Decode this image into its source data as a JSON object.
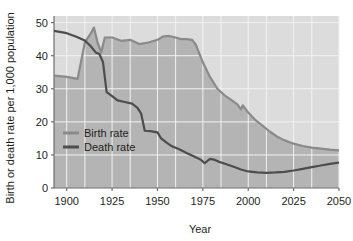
{
  "chart_data": {
    "type": "line",
    "title": "",
    "subtitle": "",
    "xlabel": "Year",
    "ylabel": "Birth or death rate per 1,000 population",
    "xlim": [
      1893,
      2050
    ],
    "ylim": [
      0,
      52
    ],
    "xticks": [
      1900,
      1925,
      1950,
      1975,
      2000,
      2025,
      2050
    ],
    "xtick_labels": [
      "1900",
      "1925",
      "1950",
      "1975",
      "2000",
      "2025",
      "2050"
    ],
    "yticks": [
      0,
      10,
      20,
      30,
      40,
      50
    ],
    "ytick_labels": [
      "0",
      "10",
      "20",
      "30",
      "40",
      "50"
    ],
    "grid": true,
    "legend_position": "inside-left",
    "series": [
      {
        "name": "Birth rate",
        "color": "#8a8a8a",
        "x": [
          1893,
          1900,
          1906,
          1908,
          1910,
          1913,
          1915,
          1917,
          1919,
          1921,
          1925,
          1930,
          1935,
          1940,
          1945,
          1950,
          1953,
          1956,
          1960,
          1963,
          1966,
          1969,
          1971,
          1975,
          1979,
          1983,
          1987,
          1991,
          1994,
          1996,
          1997,
          2000,
          2004,
          2008,
          2012,
          2016,
          2020,
          2025,
          2030,
          2035,
          2040,
          2045,
          2050
        ],
        "y": [
          34.0,
          33.6,
          33.0,
          38.5,
          44.0,
          46.5,
          48.5,
          44.0,
          41.0,
          45.5,
          45.5,
          44.5,
          44.8,
          43.5,
          44.0,
          44.8,
          45.8,
          46.0,
          45.5,
          45.0,
          45.0,
          44.8,
          43.5,
          38.0,
          33.5,
          30.0,
          28.0,
          26.5,
          25.3,
          23.8,
          25.0,
          22.8,
          20.5,
          18.8,
          17.0,
          15.5,
          14.4,
          13.4,
          12.7,
          12.2,
          11.9,
          11.6,
          11.4
        ]
      },
      {
        "name": "Death rate",
        "color": "#4d4d4d",
        "x": [
          1893,
          1900,
          1905,
          1910,
          1913,
          1916,
          1918,
          1920,
          1922,
          1925,
          1928,
          1932,
          1936,
          1939,
          1941,
          1943,
          1946,
          1950,
          1952,
          1955,
          1958,
          1962,
          1966,
          1970,
          1974,
          1976,
          1979,
          1981,
          1984,
          1988,
          1992,
          1996,
          2000,
          2005,
          2010,
          2015,
          2020,
          2025,
          2030,
          2035,
          2040,
          2045,
          2050
        ],
        "y": [
          47.5,
          46.8,
          45.8,
          44.6,
          43.0,
          41.0,
          40.5,
          38.0,
          29.0,
          27.8,
          26.5,
          26.0,
          25.5,
          24.2,
          22.5,
          17.3,
          17.2,
          16.8,
          15.0,
          13.7,
          12.6,
          11.7,
          10.6,
          9.6,
          8.5,
          7.5,
          8.8,
          8.6,
          7.9,
          7.2,
          6.4,
          5.6,
          5.0,
          4.7,
          4.6,
          4.7,
          4.9,
          5.3,
          5.8,
          6.3,
          6.8,
          7.3,
          7.7
        ]
      }
    ],
    "fill_below_birth_rate": true,
    "plot_background_upper": "#dcdcdc",
    "plot_background_lower": "#b4b4b4",
    "gridline_color": "#f2f2f2"
  },
  "legend": {
    "entries": [
      {
        "label": "Birth rate",
        "color": "#8a8a8a"
      },
      {
        "label": "Death rate",
        "color": "#4d4d4d"
      }
    ]
  },
  "axes": {
    "x_title": "Year",
    "y_title": "Birth or death rate per 1,000 population"
  }
}
